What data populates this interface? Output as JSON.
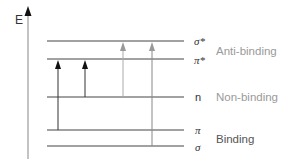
{
  "axis": {
    "label": "E"
  },
  "levels": [
    {
      "id": "sigma-star",
      "symbol": "σ*",
      "y": 41
    },
    {
      "id": "pi-star",
      "symbol": "π*",
      "y": 59
    },
    {
      "id": "n",
      "symbol": "n",
      "y": 97
    },
    {
      "id": "pi",
      "symbol": "π",
      "y": 130
    },
    {
      "id": "sigma",
      "symbol": "σ",
      "y": 146
    }
  ],
  "groups": [
    {
      "id": "anti-binding",
      "label": "Anti-binding",
      "color": "#9a9a9a"
    },
    {
      "id": "non-binding",
      "label": "Non-binding",
      "color": "#9a9a9a"
    },
    {
      "id": "binding",
      "label": "Binding",
      "color": "#555555"
    }
  ],
  "transitions": [
    {
      "from": "π",
      "to": "π*",
      "x": 58,
      "color": "#111111"
    },
    {
      "from": "n",
      "to": "π*",
      "x": 85,
      "color": "#111111"
    },
    {
      "from": "n",
      "to": "σ*",
      "x": 123,
      "color": "#999999"
    },
    {
      "from": "σ",
      "to": "σ*",
      "x": 152,
      "color": "#999999"
    }
  ]
}
